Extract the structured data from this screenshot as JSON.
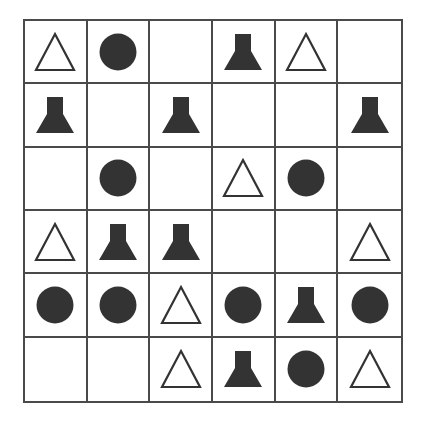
{
  "puzzle": {
    "rows": 6,
    "cols": 6,
    "colors": {
      "grid_line": "#4a4a4a",
      "shape_fill": "#333333",
      "shape_outline": "#333333",
      "background": "#ffffff"
    },
    "legend": {
      "triangle": "outlined-triangle",
      "circle": "filled-circle",
      "flask": "filled-flask",
      "empty": "empty"
    },
    "cells": [
      [
        "triangle",
        "circle",
        "empty",
        "flask",
        "triangle",
        "empty"
      ],
      [
        "flask",
        "empty",
        "flask",
        "empty",
        "empty",
        "flask"
      ],
      [
        "empty",
        "circle",
        "empty",
        "triangle",
        "circle",
        "empty"
      ],
      [
        "triangle",
        "flask",
        "flask",
        "empty",
        "empty",
        "triangle"
      ],
      [
        "circle",
        "circle",
        "triangle",
        "circle",
        "flask",
        "circle"
      ],
      [
        "empty",
        "empty",
        "triangle",
        "flask",
        "circle",
        "triangle"
      ]
    ]
  }
}
